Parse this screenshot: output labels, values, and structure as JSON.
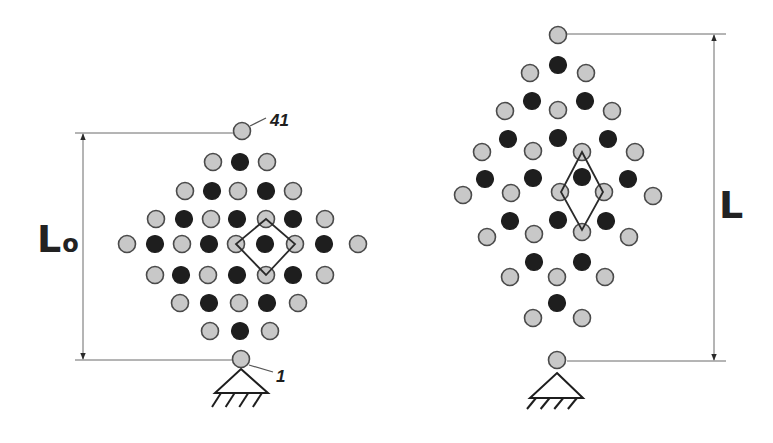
{
  "figure": {
    "colors": {
      "grey_node": "#c8c8c8",
      "black_node": "#1e1e1e",
      "line": "#2a2a2a",
      "dimension": "#6a6a6a"
    },
    "node_radius": 8.5
  },
  "left_structure": {
    "dimension_label_main": "L",
    "dimension_label_sub": "o",
    "top_node_label": "41",
    "bottom_node_label": "1",
    "nodes": [
      {
        "x": 242,
        "y": 131,
        "c": "g"
      },
      {
        "x": 213,
        "y": 162,
        "c": "g"
      },
      {
        "x": 240,
        "y": 162,
        "c": "b"
      },
      {
        "x": 267,
        "y": 162,
        "c": "g"
      },
      {
        "x": 185,
        "y": 191,
        "c": "g"
      },
      {
        "x": 212,
        "y": 191,
        "c": "b"
      },
      {
        "x": 238,
        "y": 191,
        "c": "g"
      },
      {
        "x": 266,
        "y": 191,
        "c": "b"
      },
      {
        "x": 293,
        "y": 191,
        "c": "g"
      },
      {
        "x": 156,
        "y": 219,
        "c": "g"
      },
      {
        "x": 184,
        "y": 219,
        "c": "b"
      },
      {
        "x": 211,
        "y": 219,
        "c": "g"
      },
      {
        "x": 237,
        "y": 219,
        "c": "b"
      },
      {
        "x": 266,
        "y": 219,
        "c": "g"
      },
      {
        "x": 293,
        "y": 219,
        "c": "b"
      },
      {
        "x": 325,
        "y": 219,
        "c": "g"
      },
      {
        "x": 127,
        "y": 244,
        "c": "g"
      },
      {
        "x": 155,
        "y": 244,
        "c": "b"
      },
      {
        "x": 182,
        "y": 244,
        "c": "g"
      },
      {
        "x": 209,
        "y": 244,
        "c": "b"
      },
      {
        "x": 236,
        "y": 244,
        "c": "g"
      },
      {
        "x": 265,
        "y": 244,
        "c": "b"
      },
      {
        "x": 295,
        "y": 244,
        "c": "g"
      },
      {
        "x": 324,
        "y": 244,
        "c": "b"
      },
      {
        "x": 358,
        "y": 244,
        "c": "g"
      },
      {
        "x": 155,
        "y": 275,
        "c": "g"
      },
      {
        "x": 181,
        "y": 275,
        "c": "b"
      },
      {
        "x": 208,
        "y": 275,
        "c": "g"
      },
      {
        "x": 237,
        "y": 275,
        "c": "b"
      },
      {
        "x": 266,
        "y": 275,
        "c": "g"
      },
      {
        "x": 293,
        "y": 275,
        "c": "b"
      },
      {
        "x": 325,
        "y": 275,
        "c": "g"
      },
      {
        "x": 180,
        "y": 303,
        "c": "g"
      },
      {
        "x": 209,
        "y": 303,
        "c": "b"
      },
      {
        "x": 239,
        "y": 303,
        "c": "g"
      },
      {
        "x": 267,
        "y": 303,
        "c": "b"
      },
      {
        "x": 298,
        "y": 303,
        "c": "g"
      },
      {
        "x": 210,
        "y": 331,
        "c": "g"
      },
      {
        "x": 240,
        "y": 331,
        "c": "b"
      },
      {
        "x": 270,
        "y": 331,
        "c": "g"
      },
      {
        "x": 241,
        "y": 359,
        "c": "g"
      }
    ],
    "cell": [
      [
        266,
        219
      ],
      [
        295,
        244
      ],
      [
        266,
        275
      ],
      [
        236,
        244
      ]
    ],
    "dimension": {
      "x": 83,
      "top_y": 133,
      "bottom_y": 360,
      "ext_x1": 75,
      "ext_x2": 234
    },
    "support": {
      "apex": [
        241,
        369
      ],
      "base_y": 393,
      "base_x1": 215,
      "base_x2": 268,
      "hatch_depth": 14
    }
  },
  "right_structure": {
    "dimension_label": "L",
    "nodes": [
      {
        "x": 558,
        "y": 35,
        "c": "g"
      },
      {
        "x": 558,
        "y": 65,
        "c": "b"
      },
      {
        "x": 530,
        "y": 73,
        "c": "g"
      },
      {
        "x": 586,
        "y": 73,
        "c": "g"
      },
      {
        "x": 532,
        "y": 101,
        "c": "b"
      },
      {
        "x": 585,
        "y": 101,
        "c": "b"
      },
      {
        "x": 505,
        "y": 111,
        "c": "g"
      },
      {
        "x": 558,
        "y": 110,
        "c": "g"
      },
      {
        "x": 612,
        "y": 111,
        "c": "g"
      },
      {
        "x": 508,
        "y": 139,
        "c": "b"
      },
      {
        "x": 558,
        "y": 138,
        "c": "b"
      },
      {
        "x": 608,
        "y": 139,
        "c": "b"
      },
      {
        "x": 482,
        "y": 152,
        "c": "g"
      },
      {
        "x": 533,
        "y": 151,
        "c": "g"
      },
      {
        "x": 582,
        "y": 152,
        "c": "g"
      },
      {
        "x": 635,
        "y": 152,
        "c": "g"
      },
      {
        "x": 485,
        "y": 179,
        "c": "b"
      },
      {
        "x": 533,
        "y": 178,
        "c": "b"
      },
      {
        "x": 582,
        "y": 177,
        "c": "b"
      },
      {
        "x": 628,
        "y": 179,
        "c": "b"
      },
      {
        "x": 463,
        "y": 195,
        "c": "g"
      },
      {
        "x": 511,
        "y": 193,
        "c": "g"
      },
      {
        "x": 560,
        "y": 192,
        "c": "g"
      },
      {
        "x": 604,
        "y": 192,
        "c": "g"
      },
      {
        "x": 653,
        "y": 196,
        "c": "g"
      },
      {
        "x": 510,
        "y": 221,
        "c": "b"
      },
      {
        "x": 558,
        "y": 220,
        "c": "b"
      },
      {
        "x": 606,
        "y": 221,
        "c": "b"
      },
      {
        "x": 487,
        "y": 237,
        "c": "g"
      },
      {
        "x": 534,
        "y": 234,
        "c": "g"
      },
      {
        "x": 582,
        "y": 232,
        "c": "g"
      },
      {
        "x": 629,
        "y": 237,
        "c": "g"
      },
      {
        "x": 534,
        "y": 262,
        "c": "b"
      },
      {
        "x": 582,
        "y": 262,
        "c": "b"
      },
      {
        "x": 510,
        "y": 277,
        "c": "g"
      },
      {
        "x": 557,
        "y": 277,
        "c": "g"
      },
      {
        "x": 605,
        "y": 277,
        "c": "g"
      },
      {
        "x": 557,
        "y": 303,
        "c": "b"
      },
      {
        "x": 533,
        "y": 318,
        "c": "g"
      },
      {
        "x": 582,
        "y": 318,
        "c": "g"
      },
      {
        "x": 557,
        "y": 360,
        "c": "g"
      }
    ],
    "cell": [
      [
        582,
        152
      ],
      [
        603,
        192
      ],
      [
        582,
        230
      ],
      [
        561,
        192
      ]
    ],
    "dimension": {
      "x": 714,
      "top_y": 34,
      "bottom_y": 361,
      "ext_x1": 567,
      "ext_x2": 726
    },
    "support": {
      "apex": [
        557,
        373
      ],
      "base_y": 398,
      "base_x1": 530,
      "base_x2": 583,
      "hatch_depth": 11
    }
  }
}
